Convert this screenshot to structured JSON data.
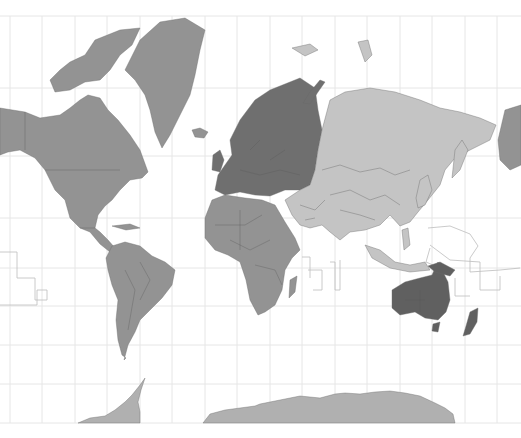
{
  "map": {
    "projection": "Mercator",
    "style": "grayscale world map with regions shaded by continent",
    "background": "#ffffff",
    "grid": {
      "color": "#e6e6e6",
      "lon_spacing_px": 32.5,
      "lat_lines_y": [
        16,
        88,
        156,
        218,
        268,
        306,
        345,
        384,
        423
      ]
    },
    "regions": [
      {
        "name": "North America",
        "color": "#939393"
      },
      {
        "name": "Greenland",
        "color": "#939393"
      },
      {
        "name": "South America",
        "color": "#939393"
      },
      {
        "name": "Africa",
        "color": "#939393"
      },
      {
        "name": "Europe",
        "color": "#6f6f6f"
      },
      {
        "name": "Asia",
        "color": "#c4c4c4"
      },
      {
        "name": "Oceania",
        "color": "#606060"
      },
      {
        "name": "Antarctica",
        "color": "#b0b0b0"
      }
    ],
    "labels": []
  }
}
